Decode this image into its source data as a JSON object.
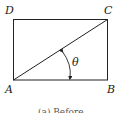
{
  "diagram": {
    "vertices": {
      "top_left": "D",
      "top_right": "C",
      "bottom_left": "A",
      "bottom_right": "B"
    },
    "angle_label": "θ",
    "caption": "(a) Before",
    "colors": {
      "stroke": "#222222",
      "background": "#ffffff"
    }
  }
}
